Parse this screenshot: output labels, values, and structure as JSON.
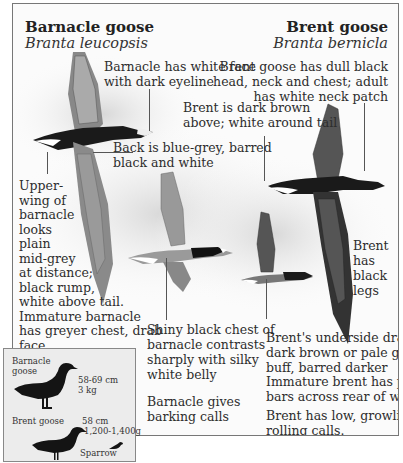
{
  "left_species": {
    "common_name": "Barnacle goose",
    "latin_name": "Branta leucopsis"
  },
  "right_species": {
    "common_name": "Brent goose",
    "latin_name": "Branta bernicla"
  },
  "labels": {
    "barnacle_face": [
      "Barnacle has white face",
      "with dark eyeline"
    ],
    "brent_head": [
      "Brent goose has dull black",
      "head, neck and chest; adult",
      "has white neck patch"
    ],
    "brent_back": [
      "Brent is dark brown",
      "above; white around tail"
    ],
    "barnacle_back": [
      "Back is blue-grey, barred",
      "black and white"
    ],
    "barnacle_upperwing": [
      "Upper-",
      "wing of",
      "barnacle",
      "looks",
      "plain",
      "mid-grey",
      "at distance;",
      "black rump,",
      "white above tail.",
      "Immature barnacle",
      "has greyer chest, drab",
      "face"
    ],
    "brent_legs": [
      "Brent",
      "has",
      "black",
      "legs"
    ],
    "barnacle_chest": [
      "Shiny black chest of",
      "barnacle contrasts",
      "sharply with silky",
      "white belly"
    ],
    "brent_underside": [
      "Brent's underside drab",
      "dark brown or pale grey-",
      "buff, barred darker"
    ],
    "brent_immature": [
      "Immature brent has pale",
      "bars across rear of wing"
    ],
    "barnacle_calls": [
      "Barnacle gives",
      "barking calls"
    ],
    "brent_calls": [
      "Brent has low, growling,",
      "rolling calls."
    ]
  },
  "size_inset": {
    "barnacle": {
      "name": [
        "Barnacle",
        "goose"
      ],
      "length": "58-69 cm",
      "weight": "3 kg"
    },
    "brent": {
      "name": "Brent goose",
      "length": "58 cm",
      "weight": "1,200-1,400g"
    },
    "sparrow": {
      "name": "Sparrow"
    }
  }
}
